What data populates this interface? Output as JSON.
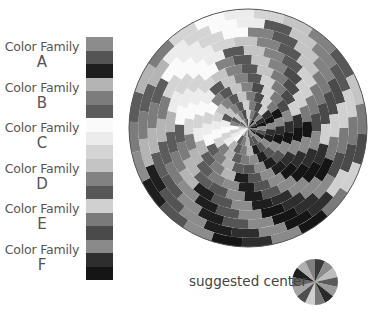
{
  "legend": {
    "families": [
      {
        "name": "Color Family",
        "letter": "A",
        "swatches": [
          "#8c8c8c",
          "#545454",
          "#1e1e1e"
        ]
      },
      {
        "name": "Color Family",
        "letter": "B",
        "swatches": [
          "#b4b4b4",
          "#7c7c7c",
          "#5c5c5c"
        ]
      },
      {
        "name": "Color Family",
        "letter": "C",
        "swatches": [
          "#fafafa",
          "#ececec",
          "#d4d4d4"
        ]
      },
      {
        "name": "Color Family",
        "letter": "D",
        "swatches": [
          "#c4c4c4",
          "#828282",
          "#575757"
        ]
      },
      {
        "name": "Color Family",
        "letter": "E",
        "swatches": [
          "#d0d0d0",
          "#7a7a7a",
          "#4a4a4a"
        ]
      },
      {
        "name": "Color Family",
        "letter": "F",
        "swatches": [
          "#8a8a8a",
          "#2e2e2e",
          "#151515"
        ]
      }
    ]
  },
  "pinwheel": {
    "cx": 248,
    "cy": 128,
    "r": 119,
    "rings": 13,
    "sectors": 24,
    "twist_per_ring_deg": 9,
    "border_color": "#555555"
  },
  "suggested_center": {
    "label": "suggested center",
    "cx": 315,
    "cy": 282,
    "r": 23,
    "wedges": [
      "#3a3a3a",
      "#8c8c8c",
      "#bdbdbd",
      "#5a5a5a",
      "#9a9a9a",
      "#2a2a2a",
      "#777777",
      "#cfcfcf",
      "#4e4e4e",
      "#a5a5a5",
      "#666666",
      "#1f1f1f",
      "#b0b0b0",
      "#808080"
    ]
  }
}
